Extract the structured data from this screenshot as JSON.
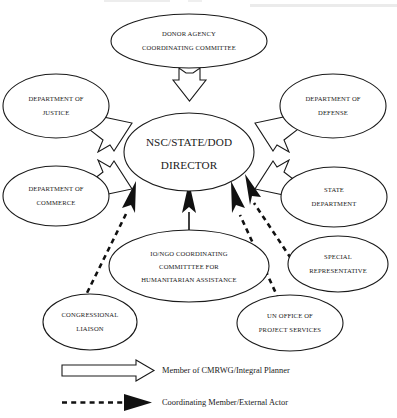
{
  "diagram": {
    "type": "organizational-relationship-diagram",
    "center": {
      "id": "nsc-state-dod-director",
      "lines": [
        "NSC/STATE/DOD",
        "DIRECTOR"
      ]
    },
    "nodes": [
      {
        "id": "donor-agency-coordinating-committee",
        "lines": [
          "DONOR AGENCY",
          "COORDINATING COMMITTEE"
        ],
        "position": "top",
        "link": "integral"
      },
      {
        "id": "department-of-justice",
        "lines": [
          "DEPARTMENT OF",
          "JUSTICE"
        ],
        "position": "upper-left",
        "link": "integral"
      },
      {
        "id": "department-of-defense",
        "lines": [
          "DEPARTMENT OF",
          "DEFENSE"
        ],
        "position": "upper-right",
        "link": "integral"
      },
      {
        "id": "department-of-commerce",
        "lines": [
          "DEPARTMENT OF",
          "COMMERCE"
        ],
        "position": "lower-left",
        "link": "integral"
      },
      {
        "id": "state-department",
        "lines": [
          "STATE",
          "DEPARTMENT"
        ],
        "position": "lower-right",
        "link": "integral"
      },
      {
        "id": "io-ngo-coordinating-committee",
        "lines": [
          "IO/NGO COORDINATING",
          "COMMITTTEE FOR",
          "HUMANITARIAN ASSISTANCE"
        ],
        "position": "bottom-center",
        "link": "integral"
      },
      {
        "id": "special-representative",
        "lines": [
          "SPECIAL",
          "REPRESENTATIVE"
        ],
        "position": "bottom-right",
        "link": "coordinating"
      },
      {
        "id": "congressional-liaison",
        "lines": [
          "CONGRESSIONAL",
          "LIAISON"
        ],
        "position": "bottom-far-left",
        "link": "coordinating"
      },
      {
        "id": "un-office-of-project-services",
        "lines": [
          "UN OFFICE OF",
          "PROJECT SERVICES"
        ],
        "position": "bottom-far-right",
        "link": "coordinating"
      }
    ],
    "legend": [
      {
        "id": "legend-integral",
        "style": "hollow-arrow",
        "label": "Member of CMRWG/Integral Planner"
      },
      {
        "id": "legend-coordinating",
        "style": "dashed-solid-arrow",
        "label": "Coordinating Member/External Actor"
      }
    ],
    "colors": {
      "stroke": "#1a1a1a",
      "fill": "#ffffff",
      "solid_arrow": "#111111",
      "background": "#ffffff"
    }
  }
}
